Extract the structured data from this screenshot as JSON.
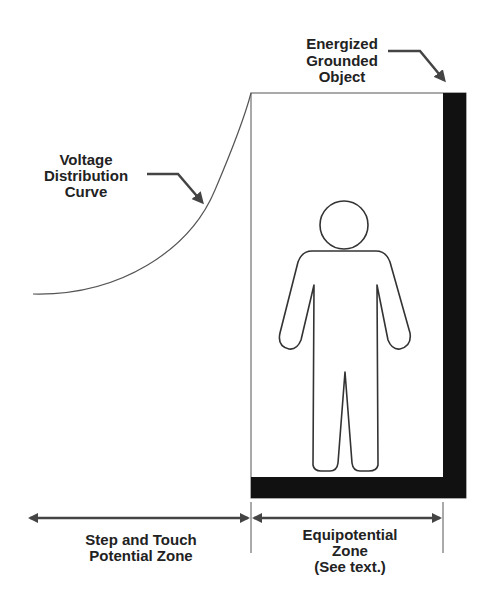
{
  "diagram": {
    "labels": {
      "energized_object": [
        "Energized",
        "Grounded",
        "Object"
      ],
      "voltage_curve": [
        "Voltage",
        "Distribution",
        "Curve"
      ],
      "step_touch_zone": [
        "Step and Touch",
        "Potential Zone"
      ],
      "equipotential_zone": [
        "Equipotential",
        "Zone",
        "(See text.)"
      ]
    },
    "colors": {
      "ink": "#222222",
      "fill_dark": "#111111",
      "line": "#555555",
      "background": "#ffffff"
    }
  }
}
